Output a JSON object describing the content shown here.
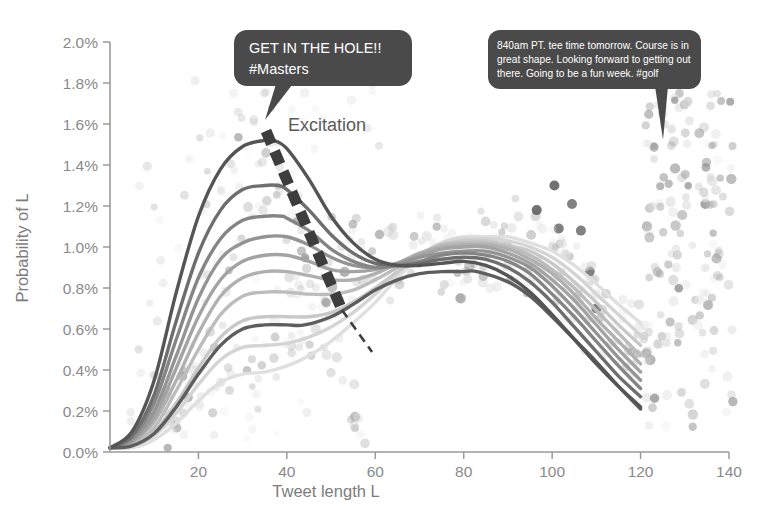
{
  "chart_data": {
    "type": "line",
    "title": "",
    "subtitle": "",
    "xlabel": "Tweet length L",
    "ylabel": "Probability of L",
    "xlim": [
      0,
      140
    ],
    "ylim": [
      0,
      2.0
    ],
    "xticks": [
      20,
      40,
      60,
      80,
      100,
      120,
      140
    ],
    "yticks": [
      "0.0%",
      "0.2%",
      "0.4%",
      "0.6%",
      "0.8%",
      "1.0%",
      "1.2%",
      "1.4%",
      "1.6%",
      "1.8%",
      "2.0%"
    ],
    "ytick_values": [
      0.0,
      0.2,
      0.4,
      0.6,
      0.8,
      1.0,
      1.2,
      1.4,
      1.6,
      1.8,
      2.0
    ],
    "y_unit": "percent",
    "grid": false,
    "legend": "none",
    "x_domain_drawn": [
      0,
      120
    ],
    "series_description": "Family of ten bimodal tweet-length probability density curves. As the curve index increases the short-tweet (first) mode shrinks while the long-tweet (second) mode near L=80 grows, i.e. the distribution shifts from short to long tweets.",
    "series": [
      {
        "name": "curve-1",
        "color": "#555555",
        "mode1": {
          "x": 37,
          "y": 1.52
        },
        "mode2": {
          "x": 80,
          "y": 0.93
        },
        "endpoints": {
          "x0": 0,
          "y0": 0.02,
          "x1": 120,
          "y1": 0.22
        },
        "x": [
          0,
          5,
          10,
          15,
          20,
          25,
          30,
          35,
          37,
          40,
          45,
          50,
          55,
          60,
          65,
          70,
          75,
          80,
          85,
          90,
          95,
          100,
          105,
          110,
          115,
          120
        ],
        "y": [
          0.02,
          0.1,
          0.35,
          0.78,
          1.15,
          1.38,
          1.49,
          1.52,
          1.52,
          1.48,
          1.33,
          1.15,
          1.02,
          0.94,
          0.91,
          0.91,
          0.92,
          0.93,
          0.91,
          0.86,
          0.78,
          0.67,
          0.55,
          0.43,
          0.32,
          0.22
        ]
      },
      {
        "name": "curve-2",
        "color": "#6e6e6e",
        "mode1": {
          "x": 38,
          "y": 1.3
        },
        "mode2": {
          "x": 81,
          "y": 0.95
        },
        "endpoints": {
          "x0": 0,
          "y0": 0.02,
          "x1": 120,
          "y1": 0.27
        },
        "x": [
          0,
          5,
          10,
          15,
          20,
          25,
          30,
          35,
          38,
          40,
          45,
          50,
          55,
          60,
          65,
          70,
          75,
          80,
          85,
          90,
          95,
          100,
          105,
          110,
          115,
          120
        ],
        "y": [
          0.02,
          0.08,
          0.28,
          0.64,
          0.97,
          1.18,
          1.28,
          1.3,
          1.3,
          1.28,
          1.18,
          1.06,
          0.97,
          0.92,
          0.91,
          0.92,
          0.94,
          0.95,
          0.94,
          0.9,
          0.83,
          0.73,
          0.61,
          0.49,
          0.37,
          0.27
        ]
      },
      {
        "name": "curve-3",
        "color": "#858585",
        "mode1": {
          "x": 39,
          "y": 1.15
        },
        "mode2": {
          "x": 81,
          "y": 0.97
        },
        "endpoints": {
          "x0": 0,
          "y0": 0.02,
          "x1": 120,
          "y1": 0.31
        },
        "x": [
          0,
          5,
          10,
          15,
          20,
          25,
          30,
          35,
          39,
          40,
          45,
          50,
          55,
          60,
          65,
          70,
          75,
          80,
          85,
          90,
          95,
          100,
          105,
          110,
          115,
          120
        ],
        "y": [
          0.02,
          0.07,
          0.24,
          0.55,
          0.85,
          1.04,
          1.13,
          1.15,
          1.15,
          1.14,
          1.08,
          0.99,
          0.93,
          0.9,
          0.91,
          0.93,
          0.96,
          0.97,
          0.96,
          0.93,
          0.87,
          0.77,
          0.66,
          0.54,
          0.42,
          0.31
        ]
      },
      {
        "name": "curve-4",
        "color": "#949494",
        "mode1": {
          "x": 40,
          "y": 1.05
        },
        "mode2": {
          "x": 82,
          "y": 0.98
        },
        "endpoints": {
          "x0": 0,
          "y0": 0.02,
          "x1": 120,
          "y1": 0.35
        },
        "x": [
          0,
          5,
          10,
          15,
          20,
          25,
          30,
          35,
          40,
          45,
          50,
          55,
          60,
          65,
          70,
          75,
          80,
          85,
          90,
          95,
          100,
          105,
          110,
          115,
          120
        ],
        "y": [
          0.02,
          0.06,
          0.2,
          0.47,
          0.75,
          0.94,
          1.02,
          1.05,
          1.05,
          1.01,
          0.95,
          0.91,
          0.9,
          0.92,
          0.95,
          0.97,
          0.98,
          0.98,
          0.95,
          0.9,
          0.81,
          0.7,
          0.58,
          0.46,
          0.35
        ]
      },
      {
        "name": "curve-5",
        "color": "#a3a3a3",
        "mode1": {
          "x": 41,
          "y": 0.96
        },
        "mode2": {
          "x": 82,
          "y": 1.0
        },
        "endpoints": {
          "x0": 0,
          "y0": 0.02,
          "x1": 120,
          "y1": 0.39
        },
        "x": [
          0,
          5,
          10,
          15,
          20,
          25,
          30,
          35,
          40,
          45,
          50,
          55,
          60,
          65,
          70,
          75,
          80,
          85,
          90,
          95,
          100,
          105,
          110,
          115,
          120
        ],
        "y": [
          0.02,
          0.05,
          0.17,
          0.41,
          0.66,
          0.84,
          0.93,
          0.96,
          0.96,
          0.93,
          0.89,
          0.88,
          0.89,
          0.92,
          0.96,
          0.99,
          1.0,
          1.0,
          0.97,
          0.92,
          0.84,
          0.74,
          0.62,
          0.5,
          0.39
        ]
      },
      {
        "name": "curve-6",
        "color": "#b0b0b0",
        "mode1": {
          "x": 42,
          "y": 0.88
        },
        "mode2": {
          "x": 83,
          "y": 1.01
        },
        "endpoints": {
          "x0": 0,
          "y0": 0.02,
          "x1": 120,
          "y1": 0.43
        },
        "x": [
          0,
          5,
          10,
          15,
          20,
          25,
          30,
          35,
          40,
          45,
          50,
          55,
          60,
          65,
          70,
          75,
          80,
          85,
          90,
          95,
          100,
          105,
          110,
          115,
          120
        ],
        "y": [
          0.02,
          0.05,
          0.15,
          0.35,
          0.58,
          0.76,
          0.85,
          0.88,
          0.88,
          0.86,
          0.84,
          0.84,
          0.87,
          0.92,
          0.97,
          1.0,
          1.01,
          1.01,
          0.99,
          0.94,
          0.87,
          0.77,
          0.65,
          0.54,
          0.43
        ]
      },
      {
        "name": "curve-7",
        "color": "#bcbcbc",
        "mode1": {
          "x": 43,
          "y": 0.78
        },
        "mode2": {
          "x": 84,
          "y": 1.02
        },
        "endpoints": {
          "x0": 0,
          "y0": 0.02,
          "x1": 120,
          "y1": 0.47
        },
        "x": [
          0,
          5,
          10,
          15,
          20,
          25,
          30,
          35,
          40,
          45,
          50,
          55,
          60,
          65,
          70,
          75,
          80,
          85,
          90,
          95,
          100,
          105,
          110,
          115,
          120
        ],
        "y": [
          0.02,
          0.04,
          0.12,
          0.3,
          0.5,
          0.67,
          0.76,
          0.78,
          0.78,
          0.77,
          0.77,
          0.79,
          0.84,
          0.9,
          0.96,
          1.01,
          1.02,
          1.02,
          1.0,
          0.96,
          0.89,
          0.8,
          0.69,
          0.58,
          0.47
        ]
      },
      {
        "name": "curve-8",
        "color": "#c8c8c8",
        "mode1": {
          "x": 44,
          "y": 0.66
        },
        "mode2": {
          "x": 84,
          "y": 1.03
        },
        "endpoints": {
          "x0": 0,
          "y0": 0.02,
          "x1": 120,
          "y1": 0.52
        },
        "x": [
          0,
          5,
          10,
          15,
          20,
          25,
          30,
          35,
          40,
          45,
          50,
          55,
          60,
          65,
          70,
          75,
          80,
          85,
          90,
          95,
          100,
          105,
          110,
          115,
          120
        ],
        "y": [
          0.02,
          0.03,
          0.1,
          0.24,
          0.41,
          0.56,
          0.64,
          0.66,
          0.66,
          0.66,
          0.68,
          0.73,
          0.8,
          0.88,
          0.96,
          1.01,
          1.03,
          1.03,
          1.01,
          0.98,
          0.92,
          0.83,
          0.73,
          0.62,
          0.52
        ]
      },
      {
        "name": "curve-9",
        "color": "#d4d4d4",
        "mode1": {
          "x": 45,
          "y": 0.52
        },
        "mode2": {
          "x": 85,
          "y": 1.04
        },
        "endpoints": {
          "x0": 0,
          "y0": 0.02,
          "x1": 120,
          "y1": 0.57
        },
        "x": [
          0,
          5,
          10,
          15,
          20,
          25,
          30,
          35,
          40,
          45,
          50,
          55,
          60,
          65,
          70,
          75,
          80,
          85,
          90,
          95,
          100,
          105,
          110,
          115,
          120
        ],
        "y": [
          0.02,
          0.03,
          0.08,
          0.19,
          0.33,
          0.45,
          0.51,
          0.52,
          0.53,
          0.56,
          0.61,
          0.68,
          0.77,
          0.87,
          0.96,
          1.02,
          1.04,
          1.04,
          1.03,
          1.0,
          0.95,
          0.87,
          0.77,
          0.67,
          0.57
        ]
      },
      {
        "name": "curve-10",
        "color": "#dfdfdf",
        "mode1": {
          "x": 46,
          "y": 0.38
        },
        "mode2": {
          "x": 86,
          "y": 1.05
        },
        "endpoints": {
          "x0": 0,
          "y0": 0.02,
          "x1": 120,
          "y1": 0.63
        },
        "x": [
          0,
          5,
          10,
          15,
          20,
          25,
          30,
          35,
          40,
          45,
          50,
          55,
          60,
          65,
          70,
          75,
          80,
          85,
          90,
          95,
          100,
          105,
          110,
          115,
          120
        ],
        "y": [
          0.02,
          0.02,
          0.06,
          0.14,
          0.25,
          0.34,
          0.38,
          0.39,
          0.42,
          0.47,
          0.54,
          0.63,
          0.73,
          0.85,
          0.95,
          1.02,
          1.05,
          1.05,
          1.05,
          1.02,
          0.98,
          0.91,
          0.82,
          0.72,
          0.63
        ]
      },
      {
        "name": "curve-dark-lower",
        "color": "#5e5e5e",
        "mode1": {
          "x": 44,
          "y": 0.62
        },
        "mode2": {
          "x": 83,
          "y": 0.88
        },
        "endpoints": {
          "x0": 0,
          "y0": 0.02,
          "x1": 120,
          "y1": 0.21
        },
        "x": [
          0,
          5,
          10,
          15,
          20,
          25,
          30,
          35,
          40,
          44,
          50,
          55,
          60,
          65,
          70,
          75,
          80,
          83,
          90,
          95,
          100,
          105,
          110,
          115,
          120
        ],
        "y": [
          0.02,
          0.03,
          0.09,
          0.22,
          0.38,
          0.52,
          0.6,
          0.62,
          0.62,
          0.62,
          0.66,
          0.72,
          0.79,
          0.84,
          0.87,
          0.88,
          0.88,
          0.88,
          0.83,
          0.76,
          0.66,
          0.55,
          0.44,
          0.32,
          0.21
        ]
      }
    ],
    "scatter": {
      "name": "tweet-length-observations",
      "description": "Semi-transparent gray dots: observed tweet-length frequency samples, dense under both modes and in a vertical band near L=135-140.",
      "n_points": 430,
      "color_range": [
        "#4f4f4f",
        "#e8e8e8"
      ],
      "marker": "circle",
      "marker_size_px": 9
    },
    "annotations": [
      {
        "name": "excitation-label",
        "text": "Excitation",
        "x_data": 42,
        "y_data": 1.55,
        "arrow": "dashed thick arrow from first mode peak (L=37, 1.52%) down-right to (L=56, 0.43%)"
      },
      {
        "name": "tweet-bubble-masters",
        "type": "speech-bubble",
        "text": "GET IN THE HOLE!!\n#Masters",
        "lines": [
          "GET IN THE HOLE!!",
          "#Masters"
        ],
        "fill": "#4a4a4a",
        "text_color": "#ffffff",
        "points_to_x_data": 34,
        "points_to_y_data": 1.55
      },
      {
        "name": "tweet-bubble-golf",
        "type": "speech-bubble",
        "text": "840am PT. tee time tomorrow. Course is in great shape. Looking forward to getting out there. Going to be a fun week. #golf",
        "lines": [
          "840am PT. tee time tomorrow. Course is in",
          "great shape. Looking forward to getting out",
          "there. Going to be a fun week. #golf"
        ],
        "fill": "#4a4a4a",
        "text_color": "#ffffff",
        "points_to_x_data": 124,
        "points_to_y_data": 1.48
      }
    ],
    "colors": {
      "axis": "#9a9a9a",
      "tick_text": "#8a8a8a",
      "axis_title": "#7d7d7d",
      "bubble_fill": "#4a4a4a",
      "bubble_text": "#ffffff",
      "annotation_text": "#5a5a5a",
      "arrow_dash": "#3d3d3d",
      "background": "#ffffff"
    }
  },
  "axes": {
    "x": {
      "title": "Tweet length L",
      "ticks": [
        "20",
        "40",
        "60",
        "80",
        "100",
        "120",
        "140"
      ]
    },
    "y": {
      "title": "Probability of L",
      "ticks": [
        "2.0%",
        "1.8%",
        "1.6%",
        "1.4%",
        "1.2%",
        "1.0%",
        "0.8%",
        "0.6%",
        "0.4%",
        "0.2%",
        "0.0%"
      ]
    }
  },
  "labels": {
    "excitation": "Excitation",
    "bubble1_line1": "GET IN THE HOLE!!",
    "bubble1_line2": "#Masters",
    "bubble2_line1": "840am PT. tee time tomorrow. Course is in",
    "bubble2_line2": "great shape. Looking forward to getting out",
    "bubble2_line3": "there. Going to be a fun week. #golf"
  }
}
